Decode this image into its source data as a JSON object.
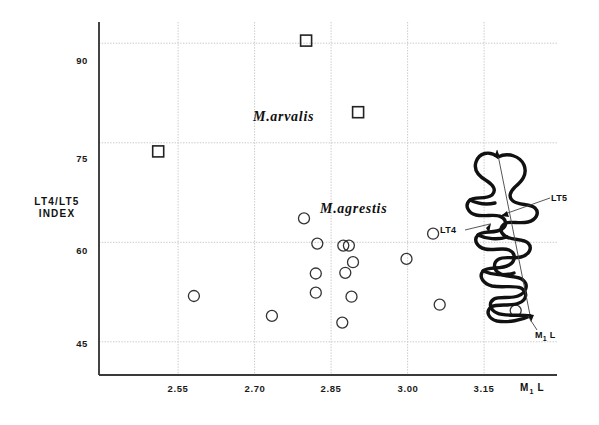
{
  "chart_data": {
    "type": "scatter",
    "title": "",
    "xlabel": "M1 L",
    "ylabel": "LT4/LT5 INDEX",
    "xlim": [
      2.395,
      3.293
    ],
    "ylim": [
      40.0,
      93.2
    ],
    "xticks": [
      2.55,
      2.7,
      2.85,
      3.0,
      3.15
    ],
    "xticklabels": [
      "2.55",
      "2.70",
      "2.85",
      "3.00",
      "3.15"
    ],
    "yticks": [
      45,
      60,
      75,
      90
    ],
    "yticklabels": [
      "45",
      "60",
      "75",
      "90"
    ],
    "grid": true,
    "grid_style": "dotted",
    "legend": "none",
    "annotations": [
      {
        "text": "M.arvalis",
        "x": 2.83,
        "y": 80.5,
        "style": "italic-serif"
      },
      {
        "text": "M.agrestis",
        "x": 2.885,
        "y": 67.0,
        "style": "italic-serif"
      },
      {
        "text": "LT5",
        "x": 3.29,
        "y": 71.0,
        "style": "tooth-callout"
      },
      {
        "text": "LT4",
        "x": 3.15,
        "y": 65.5,
        "style": "tooth-callout"
      },
      {
        "text": "M1 L",
        "x": 3.24,
        "y": 53.0,
        "style": "tooth-callout"
      }
    ],
    "series": [
      {
        "name": "M.arvalis",
        "marker": "square",
        "marker_size": 11,
        "fill": "none",
        "edge_color": "#222222",
        "points": [
          {
            "x": 2.801,
            "y": 90.4
          },
          {
            "x": 2.903,
            "y": 79.6
          },
          {
            "x": 2.511,
            "y": 73.7
          }
        ]
      },
      {
        "name": "M.agrestis",
        "marker": "circle",
        "marker_size": 11,
        "fill": "none",
        "edge_color": "#333333",
        "points": [
          {
            "x": 2.797,
            "y": 63.6
          },
          {
            "x": 2.823,
            "y": 59.8
          },
          {
            "x": 2.581,
            "y": 51.9
          },
          {
            "x": 2.734,
            "y": 48.9
          },
          {
            "x": 2.82,
            "y": 55.3
          },
          {
            "x": 2.82,
            "y": 52.4
          },
          {
            "x": 2.874,
            "y": 59.5
          },
          {
            "x": 2.885,
            "y": 59.5
          },
          {
            "x": 2.893,
            "y": 57.0
          },
          {
            "x": 2.878,
            "y": 55.4
          },
          {
            "x": 2.89,
            "y": 51.8
          },
          {
            "x": 2.872,
            "y": 47.9
          },
          {
            "x": 3.05,
            "y": 61.3
          },
          {
            "x": 2.998,
            "y": 57.5
          },
          {
            "x": 3.063,
            "y": 50.6
          },
          {
            "x": 3.212,
            "y": 49.7
          }
        ]
      }
    ]
  },
  "axis": {
    "y_title_line1": "LT4/LT5",
    "y_title_line2": "INDEX",
    "x_title_main": "M",
    "x_title_sub": "1",
    "x_title_tail": "L"
  },
  "tooth_diagram": {
    "name": "molar-tooth-outline",
    "callouts": [
      {
        "label": "LT5"
      },
      {
        "label": "LT4"
      },
      {
        "label_main": "M",
        "label_sub": "1",
        "label_tail": "L"
      }
    ]
  }
}
